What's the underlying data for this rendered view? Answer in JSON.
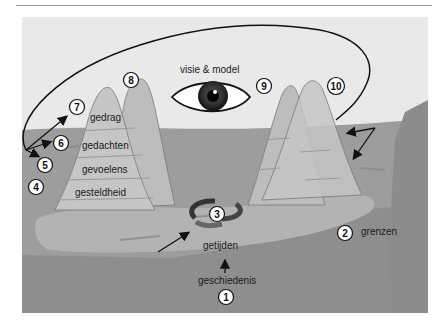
{
  "figure": {
    "title_label": "visie & model",
    "layers": {
      "gedrag": "gedrag",
      "gedachten": "gedachten",
      "gevoelens": "gevoelens",
      "gesteldheid": "gesteldheid"
    },
    "labels": {
      "getijden": "getijden",
      "geschiedenis": "geschiedenis",
      "grenzen": "grenzen"
    },
    "markers": [
      "1",
      "2",
      "3",
      "4",
      "5",
      "6",
      "7",
      "8",
      "9",
      "10"
    ],
    "colors": {
      "sky": "#e9e9e9",
      "water": "#9b9b9b",
      "deep": "#8e8e8e",
      "shelf": "#b0b0b0",
      "mountain_front": "#c4c4c4",
      "mountain_back": "#bdbdbd",
      "line": "#111111"
    }
  }
}
